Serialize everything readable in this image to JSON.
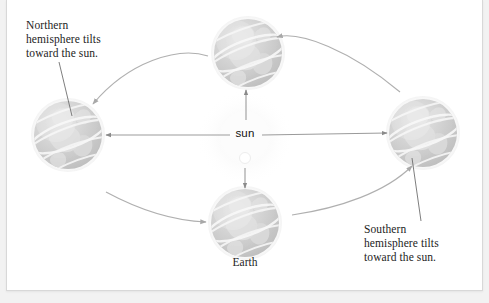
{
  "diagram": {
    "background_color": "#f2f2f2",
    "panel_color": "#ffffff",
    "panel_border_color": "#d8d8d8",
    "annotations": {
      "northern": "Northern\nhemisphere tilts\ntoward the sun.",
      "southern": "Southern\nhemisphere tilts\ntoward the sun."
    },
    "labels": {
      "sun": "sun",
      "earth": "Earth"
    },
    "globes": [
      {
        "name": "globe-top",
        "cx": 248,
        "cy": 53,
        "r": 34
      },
      {
        "name": "globe-left",
        "cx": 68,
        "cy": 135,
        "r": 34
      },
      {
        "name": "globe-right",
        "cx": 423,
        "cy": 133,
        "r": 34
      },
      {
        "name": "globe-bottom",
        "cx": 245,
        "cy": 223,
        "r": 34
      }
    ],
    "sun": {
      "cx": 245,
      "cy": 138,
      "r": 26,
      "glow_color": "#fafafa"
    },
    "colors": {
      "globe_fill": "#cfcfcf",
      "globe_line": "#f2f2f2",
      "ray_line": "#8f8f8f",
      "orbit_arc": "#9a9a9a",
      "leader_line": "#6f6f6f",
      "text": "#1d1d1d"
    }
  }
}
